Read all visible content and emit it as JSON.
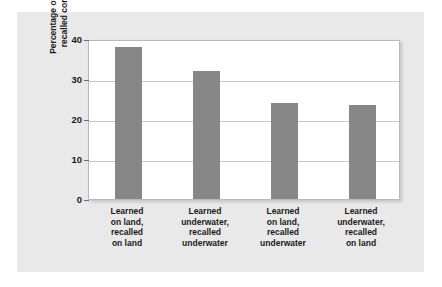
{
  "chart_data": {
    "type": "bar",
    "title": "",
    "xlabel": "",
    "ylabel": "Percentage of words\nrecalled correctly",
    "categories": [
      "Learned\non land,\nrecalled\non land",
      "Learned\nunderwater,\nrecalled\nunderwater",
      "Learned\non land,\nrecalled\nunderwater",
      "Learned\nunderwater,\nrecalled\non land"
    ],
    "values": [
      38,
      32,
      24,
      23.5
    ],
    "ylim": [
      0,
      40
    ],
    "yticks": [
      0,
      10,
      20,
      30,
      40
    ],
    "ytick_labels": [
      "0",
      "10",
      "20",
      "30",
      "40"
    ],
    "grid": true,
    "legend": "none",
    "bar_color": "#878787",
    "plot_background": "#ffffff",
    "panel_background": "#e9e9e9",
    "gridline_color": "#c9c9c9",
    "axis_color": "#6e6e6e",
    "text_color": "#1a1a1a"
  }
}
